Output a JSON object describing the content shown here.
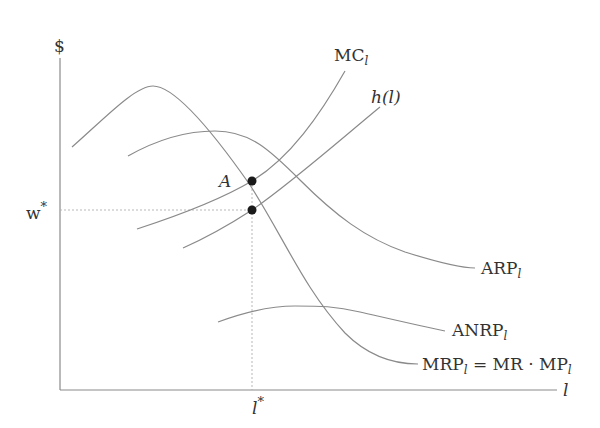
{
  "diagram": {
    "title": "",
    "axes": {
      "y_label": "$",
      "x_label": "l"
    },
    "markers": {
      "w_star": {
        "label": "w",
        "sup": "*"
      },
      "l_star": {
        "label": "l",
        "sup": "*"
      },
      "point_a": {
        "label": "A"
      }
    },
    "curves": {
      "mc": {
        "label": "MC",
        "sub": "l"
      },
      "h": {
        "label": "h(l)"
      },
      "arp": {
        "label": "ARP",
        "sub": "l"
      },
      "anrp": {
        "label": "ANRP",
        "sub": "l"
      },
      "mrp": {
        "label": "MRP",
        "sub": "l",
        "rhs_1": " = MR · MP",
        "rhs_sub": "l"
      }
    },
    "colors": {
      "curve": "#8a8a8a",
      "dot": "#1a1a1a",
      "text": "#333333"
    }
  }
}
